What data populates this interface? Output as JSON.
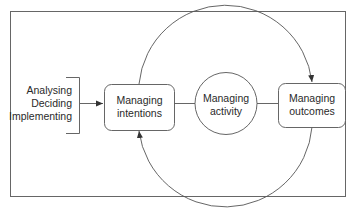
{
  "diagram": {
    "type": "cycle-diagram",
    "inputs": [
      "Analysing",
      "Deciding",
      "Implementing"
    ],
    "nodes": {
      "intentions": {
        "line1": "Managing",
        "line2": "intentions",
        "shape": "rounded-rect"
      },
      "activity": {
        "line1": "Managing",
        "line2": "activity",
        "shape": "circle"
      },
      "outcomes": {
        "line1": "Managing",
        "line2": "outcomes",
        "shape": "rounded-rect"
      }
    },
    "edges": [
      {
        "from": "inputs",
        "to": "intentions",
        "style": "arrow"
      },
      {
        "from": "intentions",
        "to": "activity",
        "style": "line"
      },
      {
        "from": "activity",
        "to": "outcomes",
        "style": "line"
      },
      {
        "from": "intentions",
        "to": "outcomes",
        "style": "arc-arrow-top"
      },
      {
        "from": "outcomes",
        "to": "intentions",
        "style": "arc-arrow-bottom"
      }
    ],
    "colors": {
      "stroke": "#555555",
      "text": "#2a2a2a",
      "background": "#ffffff"
    }
  }
}
